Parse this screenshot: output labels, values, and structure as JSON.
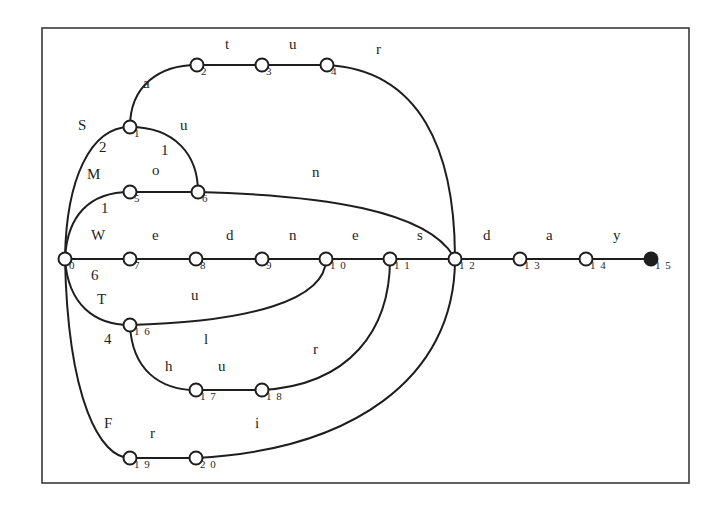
{
  "diagram": {
    "type": "finite-state-automaton",
    "frame": {
      "x": 42,
      "y": 28,
      "width": 647,
      "height": 455
    },
    "nodes": [
      {
        "id": "0",
        "label": "0",
        "x": 65,
        "y": 259,
        "final": false
      },
      {
        "id": "1",
        "label": "1",
        "x": 130,
        "y": 127,
        "final": false
      },
      {
        "id": "2",
        "label": "2",
        "x": 197,
        "y": 65,
        "final": false
      },
      {
        "id": "3",
        "label": "3",
        "x": 262,
        "y": 65,
        "final": false
      },
      {
        "id": "4",
        "label": "4",
        "x": 327,
        "y": 65,
        "final": false
      },
      {
        "id": "5",
        "label": "5",
        "x": 130,
        "y": 192,
        "final": false
      },
      {
        "id": "6",
        "label": "6",
        "x": 198,
        "y": 192,
        "final": false
      },
      {
        "id": "7",
        "label": "7",
        "x": 130,
        "y": 259,
        "final": false
      },
      {
        "id": "8",
        "label": "8",
        "x": 196,
        "y": 259,
        "final": false
      },
      {
        "id": "9",
        "label": "9",
        "x": 262,
        "y": 259,
        "final": false
      },
      {
        "id": "10",
        "label": "1 0",
        "x": 326,
        "y": 259,
        "final": false
      },
      {
        "id": "11",
        "label": "1 1",
        "x": 390,
        "y": 259,
        "final": false
      },
      {
        "id": "12",
        "label": "1 2",
        "x": 455,
        "y": 259,
        "final": false
      },
      {
        "id": "13",
        "label": "1 3",
        "x": 520,
        "y": 259,
        "final": false
      },
      {
        "id": "14",
        "label": "1 4",
        "x": 586,
        "y": 259,
        "final": false
      },
      {
        "id": "15",
        "label": "1 5",
        "x": 651,
        "y": 259,
        "final": true
      },
      {
        "id": "16",
        "label": "1 6",
        "x": 130,
        "y": 325,
        "final": false
      },
      {
        "id": "17",
        "label": "1 7",
        "x": 196,
        "y": 390,
        "final": false
      },
      {
        "id": "18",
        "label": "1 8",
        "x": 262,
        "y": 390,
        "final": false
      },
      {
        "id": "19",
        "label": "1 9",
        "x": 130,
        "y": 458,
        "final": false
      },
      {
        "id": "20",
        "label": "2 0",
        "x": 196,
        "y": 458,
        "final": false
      }
    ],
    "edges": [
      {
        "from": "0",
        "to": "1",
        "path": "M65,259 C66,180 90,127 130,127"
      },
      {
        "from": "1",
        "to": "2",
        "path": "M130,127 C130,85 160,65 197,65"
      },
      {
        "from": "2",
        "to": "3",
        "path": "M197,65 L262,65"
      },
      {
        "from": "3",
        "to": "4",
        "path": "M262,65 L327,65"
      },
      {
        "from": "4",
        "to": "12",
        "path": "M327,65 C420,70 455,150 455,259"
      },
      {
        "from": "1",
        "to": "6",
        "path": "M130,127 C175,127 198,155 198,192"
      },
      {
        "from": "0",
        "to": "5",
        "path": "M65,259 C67,215 90,192 130,192"
      },
      {
        "from": "5",
        "to": "6",
        "path": "M130,192 L198,192"
      },
      {
        "from": "6",
        "to": "12",
        "path": "M198,192 C320,195 430,210 455,259"
      },
      {
        "from": "0",
        "to": "7",
        "path": "M65,259 L130,259"
      },
      {
        "from": "7",
        "to": "8",
        "path": "M130,259 L196,259"
      },
      {
        "from": "8",
        "to": "9",
        "path": "M196,259 L262,259"
      },
      {
        "from": "9",
        "to": "10",
        "path": "M262,259 L326,259"
      },
      {
        "from": "10",
        "to": "11",
        "path": "M326,259 L390,259"
      },
      {
        "from": "11",
        "to": "12",
        "path": "M390,259 L455,259"
      },
      {
        "from": "12",
        "to": "13",
        "path": "M455,259 L520,259"
      },
      {
        "from": "13",
        "to": "14",
        "path": "M520,259 L586,259"
      },
      {
        "from": "14",
        "to": "15",
        "path": "M586,259 L651,259"
      },
      {
        "from": "0",
        "to": "16",
        "path": "M65,259 C68,305 95,325 130,325"
      },
      {
        "from": "16",
        "to": "10",
        "path": "M130,325 C250,322 326,300 326,259"
      },
      {
        "from": "16",
        "to": "17",
        "path": "M130,325 C132,370 160,390 196,390"
      },
      {
        "from": "17",
        "to": "18",
        "path": "M196,390 L262,390"
      },
      {
        "from": "18",
        "to": "11",
        "path": "M262,390 C350,385 390,330 390,259"
      },
      {
        "from": "0",
        "to": "19",
        "path": "M65,259 C68,400 100,458 130,458"
      },
      {
        "from": "19",
        "to": "20",
        "path": "M130,458 L196,458"
      },
      {
        "from": "20",
        "to": "12",
        "path": "M196,458 C350,450 455,380 455,259"
      }
    ],
    "edge_labels": [
      {
        "text": "a",
        "x": 143,
        "y": 88
      },
      {
        "text": "t",
        "x": 225,
        "y": 49
      },
      {
        "text": "u",
        "x": 289,
        "y": 49
      },
      {
        "text": "r",
        "x": 376,
        "y": 54
      },
      {
        "text": "S",
        "x": 78,
        "y": 130
      },
      {
        "text": "u",
        "x": 180,
        "y": 130
      },
      {
        "text": "2",
        "x": 99,
        "y": 152
      },
      {
        "text": "1",
        "x": 161,
        "y": 155
      },
      {
        "text": "M",
        "x": 87,
        "y": 179
      },
      {
        "text": "o",
        "x": 152,
        "y": 175
      },
      {
        "text": "n",
        "x": 312,
        "y": 177
      },
      {
        "text": "1",
        "x": 101,
        "y": 213
      },
      {
        "text": "W",
        "x": 91,
        "y": 240
      },
      {
        "text": "e",
        "x": 152,
        "y": 240
      },
      {
        "text": "d",
        "x": 226,
        "y": 240
      },
      {
        "text": "n",
        "x": 289,
        "y": 240
      },
      {
        "text": "e",
        "x": 352,
        "y": 240
      },
      {
        "text": "s",
        "x": 417,
        "y": 240
      },
      {
        "text": "d",
        "x": 483,
        "y": 240
      },
      {
        "text": "a",
        "x": 546,
        "y": 240
      },
      {
        "text": "y",
        "x": 613,
        "y": 240
      },
      {
        "text": "6",
        "x": 91,
        "y": 280
      },
      {
        "text": "T",
        "x": 97,
        "y": 304
      },
      {
        "text": "u",
        "x": 191,
        "y": 300
      },
      {
        "text": "4",
        "x": 104,
        "y": 344
      },
      {
        "text": "l",
        "x": 204,
        "y": 344
      },
      {
        "text": "r",
        "x": 313,
        "y": 354
      },
      {
        "text": "h",
        "x": 165,
        "y": 371
      },
      {
        "text": "u",
        "x": 218,
        "y": 371
      },
      {
        "text": "F",
        "x": 104,
        "y": 428
      },
      {
        "text": "r",
        "x": 150,
        "y": 438
      },
      {
        "text": "i",
        "x": 255,
        "y": 428
      }
    ]
  }
}
